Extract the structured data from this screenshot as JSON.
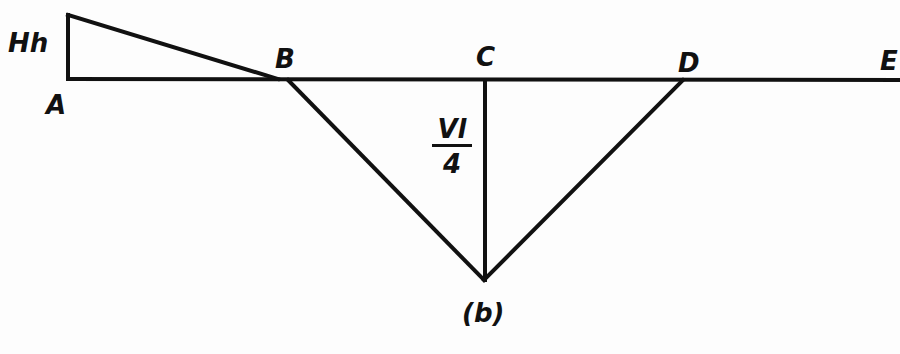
{
  "diagram": {
    "type": "bending moment diagram",
    "labels": {
      "Hh": "Hh",
      "A": "A",
      "B": "B",
      "C": "C",
      "D": "D",
      "E": "E",
      "vl_num": "Vl",
      "vl_den": "4",
      "caption": "(b)"
    },
    "stroke_color": "#111111",
    "background": "#fdfdfd"
  }
}
